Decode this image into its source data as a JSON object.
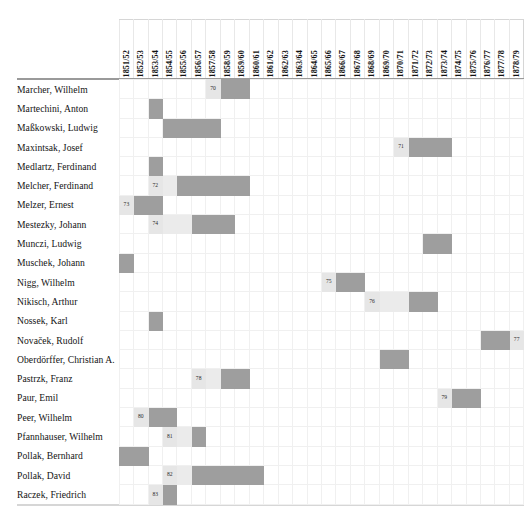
{
  "chart_data": {
    "type": "gantt",
    "title": "",
    "xlabel": "",
    "ylabel": "",
    "grid": true,
    "legend": "none",
    "categories": [
      "1851/52",
      "1852/53",
      "1853/54",
      "1854/55",
      "1855/56",
      "1856/57",
      "1857/58",
      "1858/59",
      "1859/60",
      "1860/61",
      "1861/62",
      "1862/63",
      "1863/64",
      "1864/65",
      "1865/66",
      "1866/67",
      "1867/68",
      "1868/69",
      "1869/70",
      "1870/71",
      "1871/72",
      "1872/73",
      "1873/74",
      "1874/75",
      "1875/76",
      "1876/77",
      "1877/78",
      "1878/79"
    ],
    "rows": [
      {
        "label": "Marcher, Wilhelm",
        "spans": [
          {
            "start": 6,
            "end": 6,
            "kind": "note",
            "note": "70"
          },
          {
            "start": 7,
            "end": 8,
            "kind": "on"
          }
        ]
      },
      {
        "label": "Martechini, Anton",
        "spans": [
          {
            "start": 2,
            "end": 2,
            "kind": "on"
          }
        ]
      },
      {
        "label": "Maßkowski, Ludwig",
        "spans": [
          {
            "start": 3,
            "end": 6,
            "kind": "on"
          }
        ]
      },
      {
        "label": "Maxintsak, Josef",
        "spans": [
          {
            "start": 19,
            "end": 19,
            "kind": "note",
            "note": "71"
          },
          {
            "start": 20,
            "end": 22,
            "kind": "on"
          }
        ]
      },
      {
        "label": "Medlartz, Ferdinand",
        "spans": [
          {
            "start": 2,
            "end": 2,
            "kind": "on"
          }
        ]
      },
      {
        "label": "Melcher, Ferdinand",
        "spans": [
          {
            "start": 2,
            "end": 2,
            "kind": "note",
            "note": "72"
          },
          {
            "start": 3,
            "end": 3,
            "kind": "light"
          },
          {
            "start": 4,
            "end": 8,
            "kind": "on"
          }
        ]
      },
      {
        "label": "Melzer, Ernest",
        "spans": [
          {
            "start": 0,
            "end": 0,
            "kind": "note",
            "note": "73"
          },
          {
            "start": 1,
            "end": 2,
            "kind": "on"
          }
        ]
      },
      {
        "label": "Mestezky, Johann",
        "spans": [
          {
            "start": 2,
            "end": 2,
            "kind": "note",
            "note": "74"
          },
          {
            "start": 3,
            "end": 4,
            "kind": "light"
          },
          {
            "start": 5,
            "end": 7,
            "kind": "on"
          }
        ]
      },
      {
        "label": "Munczi, Ludwig",
        "spans": [
          {
            "start": 21,
            "end": 22,
            "kind": "on"
          }
        ]
      },
      {
        "label": "Muschek, Johann",
        "spans": [
          {
            "start": 0,
            "end": 0,
            "kind": "on"
          }
        ]
      },
      {
        "label": "Nigg, Wilhelm",
        "spans": [
          {
            "start": 14,
            "end": 14,
            "kind": "note",
            "note": "75"
          },
          {
            "start": 15,
            "end": 16,
            "kind": "on"
          }
        ]
      },
      {
        "label": "Nikisch, Arthur",
        "spans": [
          {
            "start": 17,
            "end": 17,
            "kind": "note",
            "note": "76"
          },
          {
            "start": 18,
            "end": 19,
            "kind": "light"
          },
          {
            "start": 20,
            "end": 21,
            "kind": "on"
          }
        ]
      },
      {
        "label": "Nossek, Karl",
        "spans": [
          {
            "start": 2,
            "end": 2,
            "kind": "on"
          }
        ]
      },
      {
        "label": "Novaček, Rudolf",
        "spans": [
          {
            "start": 25,
            "end": 26,
            "kind": "on"
          },
          {
            "start": 27,
            "end": 27,
            "kind": "note",
            "note": "77"
          }
        ]
      },
      {
        "label": "Oberdörffer, Christian A.",
        "spans": [
          {
            "start": 18,
            "end": 19,
            "kind": "on"
          }
        ]
      },
      {
        "label": "Pastrzk, Franz",
        "spans": [
          {
            "start": 5,
            "end": 5,
            "kind": "note",
            "note": "78"
          },
          {
            "start": 6,
            "end": 6,
            "kind": "light"
          },
          {
            "start": 7,
            "end": 8,
            "kind": "on"
          }
        ]
      },
      {
        "label": "Paur, Emil",
        "spans": [
          {
            "start": 22,
            "end": 22,
            "kind": "note",
            "note": "79"
          },
          {
            "start": 23,
            "end": 24,
            "kind": "on"
          }
        ]
      },
      {
        "label": "Peer, Wilhelm",
        "spans": [
          {
            "start": 1,
            "end": 1,
            "kind": "note",
            "note": "80"
          },
          {
            "start": 2,
            "end": 3,
            "kind": "on"
          }
        ]
      },
      {
        "label": "Pfannhauser, Wilhelm",
        "spans": [
          {
            "start": 3,
            "end": 3,
            "kind": "note",
            "note": "81"
          },
          {
            "start": 4,
            "end": 4,
            "kind": "light"
          },
          {
            "start": 5,
            "end": 5,
            "kind": "on"
          }
        ]
      },
      {
        "label": "Pollak, Bernhard",
        "spans": [
          {
            "start": 0,
            "end": 1,
            "kind": "on"
          }
        ]
      },
      {
        "label": "Pollak, David",
        "spans": [
          {
            "start": 3,
            "end": 3,
            "kind": "note",
            "note": "82"
          },
          {
            "start": 4,
            "end": 4,
            "kind": "light"
          },
          {
            "start": 5,
            "end": 9,
            "kind": "on"
          }
        ]
      },
      {
        "label": "Raczek, Friedrich",
        "spans": [
          {
            "start": 2,
            "end": 2,
            "kind": "note",
            "note": "83"
          },
          {
            "start": 3,
            "end": 3,
            "kind": "on"
          }
        ]
      }
    ],
    "colors": {
      "active_cell": "#9e9e9e",
      "note_cell": "#e6e6e6",
      "light_cell": "#ebebeb",
      "grid_line": "#f0f0f0",
      "rule": "#9a9a9a",
      "text": "#141414"
    }
  }
}
